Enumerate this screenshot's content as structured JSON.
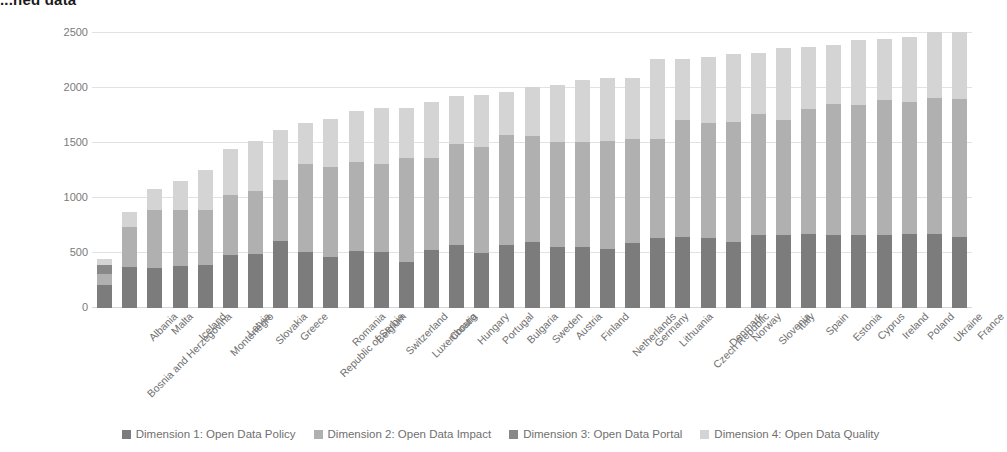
{
  "title": "...ned data",
  "chart_data": {
    "type": "bar",
    "stacked": true,
    "title": "...ned data",
    "xlabel": "",
    "ylabel": "",
    "ylim": [
      0,
      2500
    ],
    "yticks": [
      0,
      500,
      1000,
      1500,
      2000,
      2500
    ],
    "grid": true,
    "legend_position": "bottom",
    "categories": [
      "Bosnia and Herzegovina",
      "Albania",
      "Malta",
      "Iceland",
      "Montenegro",
      "Latvia",
      "Slovakia",
      "Greece",
      "Republic of Serbia",
      "Romania",
      "Belgium",
      "Switzerland",
      "Luxembourg",
      "Croatia",
      "Hungary",
      "Portugal",
      "Bulgaria",
      "Sweden",
      "Austria",
      "Finland",
      "Netherlands",
      "Germany",
      "Lithuania",
      "Czech Republic",
      "Denmark",
      "Norway",
      "Slovenia",
      "Italy",
      "Spain",
      "Estonia",
      "Cyprus",
      "Ireland",
      "Poland",
      "Ukraine",
      "France"
    ],
    "series": [
      {
        "name": "Dimension 1: Open Data Policy",
        "color": "#7c7c7c",
        "values": [
          210,
          370,
          360,
          385,
          390,
          480,
          490,
          610,
          505,
          460,
          520,
          510,
          420,
          525,
          570,
          500,
          575,
          600,
          555,
          555,
          540,
          590,
          640,
          650,
          635,
          600,
          660,
          660,
          670,
          660,
          665,
          665,
          670,
          675,
          650
        ]
      },
      {
        "name": "Dimension 2: Open Data Impact",
        "color": "#b0b0b0",
        "values": [
          95,
          370,
          530,
          505,
          500,
          550,
          575,
          550,
          800,
          820,
          810,
          795,
          945,
          840,
          920,
          965,
          995,
          960,
          955,
          955,
          975,
          945,
          895,
          1060,
          1050,
          1095,
          1100,
          1045,
          1140,
          1195,
          1180,
          1225,
          1200,
          1230,
          1250
        ]
      },
      {
        "name": "Dimension 3: Open Data Portal",
        "color": "#888888",
        "values": [
          90,
          0,
          0,
          0,
          0,
          0,
          0,
          0,
          0,
          0,
          0,
          0,
          0,
          0,
          0,
          0,
          0,
          0,
          0,
          0,
          0,
          0,
          0,
          0,
          0,
          0,
          0,
          0,
          0,
          0,
          0,
          0,
          0,
          0,
          0
        ]
      },
      {
        "name": "Dimension 4: Open Data Quality",
        "color": "#d4d4d4",
        "values": [
          55,
          135,
          190,
          265,
          365,
          420,
          455,
          460,
          375,
          435,
          460,
          515,
          455,
          510,
          440,
          475,
          395,
          450,
          515,
          560,
          580,
          560,
          725,
          550,
          600,
          615,
          555,
          655,
          560,
          540,
          595,
          555,
          590,
          605,
          610
        ]
      }
    ]
  },
  "axis": {
    "ytick_labels": [
      "2500",
      "2000",
      "1500",
      "1000",
      "500",
      "0"
    ]
  },
  "legend": {
    "items": [
      {
        "label": "Dimension 1: Open Data Policy",
        "color": "#7c7c7c"
      },
      {
        "label": "Dimension 2: Open Data Impact",
        "color": "#b0b0b0"
      },
      {
        "label": "Dimension 3: Open Data Portal",
        "color": "#888888"
      },
      {
        "label": "Dimension 4: Open Data Quality",
        "color": "#d4d4d4"
      }
    ]
  }
}
